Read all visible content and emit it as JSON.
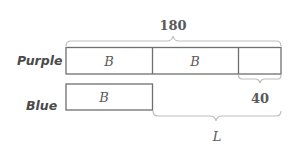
{
  "diagram": {
    "type": "tape-diagram",
    "rows": [
      {
        "label": "Purple",
        "segments": [
          {
            "label": "B"
          },
          {
            "label": "B"
          },
          {
            "label": ""
          }
        ]
      },
      {
        "label": "Blue",
        "segments": [
          {
            "label": "B"
          }
        ]
      }
    ],
    "braces": {
      "total": {
        "label": "180",
        "spans": "entire Purple bar"
      },
      "extra": {
        "label": "40",
        "spans": "third Purple segment"
      },
      "difference": {
        "label": "L",
        "spans": "Purple beyond Blue"
      }
    },
    "colors": {
      "box_stroke": "#6f6f6f",
      "brace_stroke": "#bdbdbd",
      "text": "#5a5a5a"
    }
  }
}
